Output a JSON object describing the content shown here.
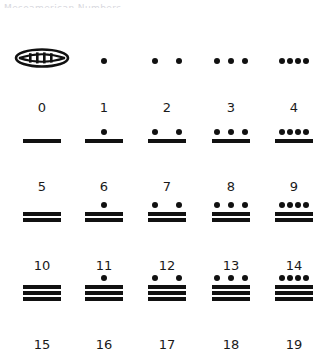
{
  "header": {
    "line1": "Mesoamerican  Numbers",
    "line2": "clipped"
  },
  "chart_data": {
    "type": "table",
    "xlabel": "",
    "ylabel": "",
    "columns": 5,
    "rows": 4,
    "symbol_legend": {
      "dot": "1",
      "bar": "5",
      "shell": "0"
    },
    "categories": [
      "0",
      "1",
      "2",
      "3",
      "4",
      "5",
      "6",
      "7",
      "8",
      "9",
      "10",
      "11",
      "12",
      "13",
      "14",
      "15",
      "16",
      "17",
      "18",
      "19"
    ],
    "values": [
      0,
      1,
      2,
      3,
      4,
      5,
      6,
      7,
      8,
      9,
      10,
      11,
      12,
      13,
      14,
      15,
      16,
      17,
      18,
      19
    ],
    "entries": [
      {
        "label": "0",
        "value": 0,
        "dots": 0,
        "bars": 0,
        "shell": true
      },
      {
        "label": "1",
        "value": 1,
        "dots": 1,
        "bars": 0,
        "shell": false
      },
      {
        "label": "2",
        "value": 2,
        "dots": 2,
        "bars": 0,
        "shell": false
      },
      {
        "label": "3",
        "value": 3,
        "dots": 3,
        "bars": 0,
        "shell": false
      },
      {
        "label": "4",
        "value": 4,
        "dots": 4,
        "bars": 0,
        "shell": false
      },
      {
        "label": "5",
        "value": 5,
        "dots": 0,
        "bars": 1,
        "shell": false
      },
      {
        "label": "6",
        "value": 6,
        "dots": 1,
        "bars": 1,
        "shell": false
      },
      {
        "label": "7",
        "value": 7,
        "dots": 2,
        "bars": 1,
        "shell": false
      },
      {
        "label": "8",
        "value": 8,
        "dots": 3,
        "bars": 1,
        "shell": false
      },
      {
        "label": "9",
        "value": 9,
        "dots": 4,
        "bars": 1,
        "shell": false
      },
      {
        "label": "10",
        "value": 10,
        "dots": 0,
        "bars": 2,
        "shell": false
      },
      {
        "label": "11",
        "value": 11,
        "dots": 1,
        "bars": 2,
        "shell": false
      },
      {
        "label": "12",
        "value": 12,
        "dots": 2,
        "bars": 2,
        "shell": false
      },
      {
        "label": "13",
        "value": 13,
        "dots": 3,
        "bars": 2,
        "shell": false
      },
      {
        "label": "14",
        "value": 14,
        "dots": 4,
        "bars": 2,
        "shell": false
      },
      {
        "label": "15",
        "value": 15,
        "dots": 0,
        "bars": 3,
        "shell": false
      },
      {
        "label": "16",
        "value": 16,
        "dots": 1,
        "bars": 3,
        "shell": false
      },
      {
        "label": "17",
        "value": 17,
        "dots": 2,
        "bars": 3,
        "shell": false
      },
      {
        "label": "18",
        "value": 18,
        "dots": 3,
        "bars": 3,
        "shell": false
      },
      {
        "label": "19",
        "value": 19,
        "dots": 4,
        "bars": 3,
        "shell": false
      }
    ],
    "colors": {
      "ink": "#111111",
      "background": "#ffffff",
      "label": "#1a1a1a",
      "header_faint": "#d8d8de"
    }
  }
}
